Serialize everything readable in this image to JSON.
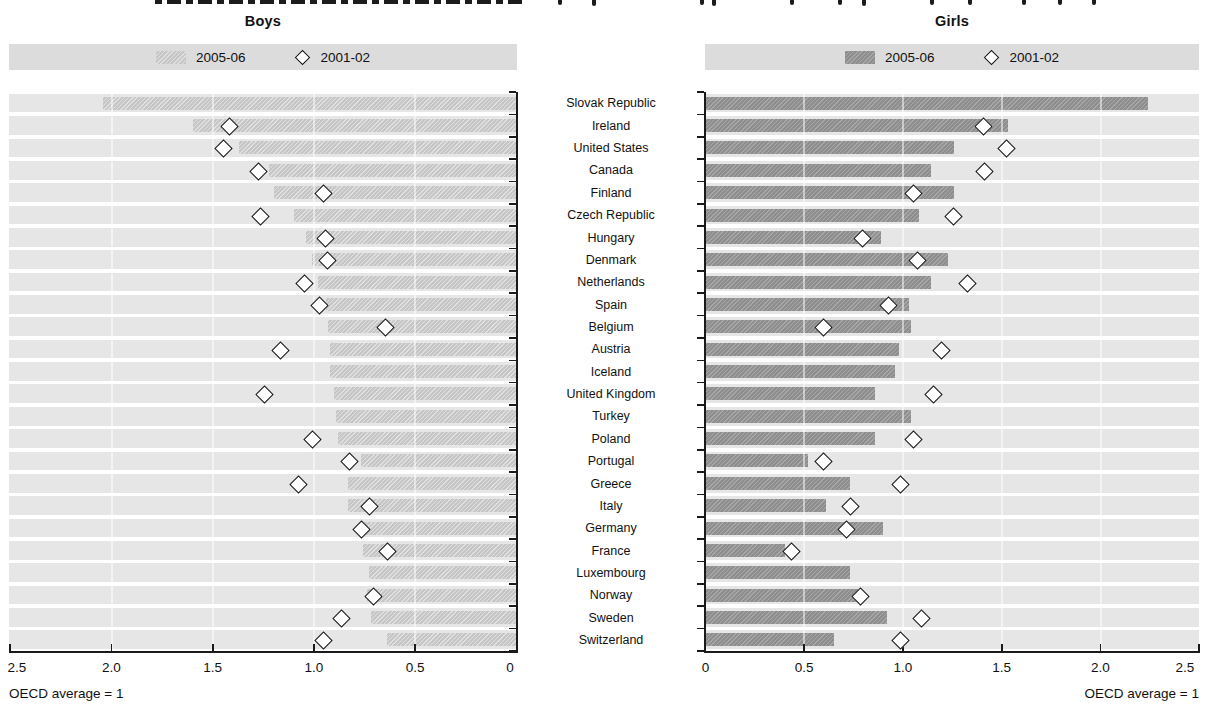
{
  "figure": {
    "cropped_title_visible": true,
    "note_left": "OECD average = 1",
    "note_right": "OECD average = 1"
  },
  "panels": {
    "left": {
      "title": "Boys",
      "legend": {
        "bar_label": "2005-06",
        "diamond_label": "2001-02"
      },
      "axis_ticks": [
        "2.5",
        "2.0",
        "1.5",
        "1.0",
        "0.5",
        "0"
      ]
    },
    "right": {
      "title": "Girls",
      "legend": {
        "bar_label": "2005-06",
        "diamond_label": "2001-02"
      },
      "axis_ticks": [
        "0",
        "0.5",
        "1.0",
        "1.5",
        "2.0",
        "2.5"
      ]
    }
  },
  "colors": {
    "row_band": "#e6e6e6",
    "boys_bar": "#c6c6c6",
    "girls_bar": "#8e8e8e",
    "legend_band": "#dcdcdc",
    "axis": "#1a1a1a",
    "diamond_fill": "#ffffff"
  },
  "chart_data": {
    "type": "bar",
    "layout": "horizontal back-to-back pyramid, boys axis reversed (2.5 to 0), girls axis 0 to 2.5",
    "xlim": [
      0,
      2.5
    ],
    "grid": "white vertical gridlines every 0.5",
    "note": "OECD average = 1",
    "categories": [
      "Slovak Republic",
      "Ireland",
      "United States",
      "Canada",
      "Finland",
      "Czech Republic",
      "Hungary",
      "Denmark",
      "Netherlands",
      "Spain",
      "Belgium",
      "Austria",
      "Iceland",
      "United Kingdom",
      "Turkey",
      "Poland",
      "Portugal",
      "Greece",
      "Italy",
      "Germany",
      "France",
      "Luxembourg",
      "Norway",
      "Sweden",
      "Switzerland"
    ],
    "series": [
      {
        "name": "Boys 2005-06",
        "marker": "bar",
        "values": [
          2.04,
          1.6,
          1.37,
          1.22,
          1.2,
          1.1,
          1.04,
          1.01,
          0.98,
          0.94,
          0.93,
          0.92,
          0.92,
          0.9,
          0.89,
          0.88,
          0.77,
          0.83,
          0.83,
          0.78,
          0.76,
          0.73,
          0.74,
          0.72,
          0.64
        ]
      },
      {
        "name": "Boys 2001-02",
        "marker": "diamond",
        "values": [
          null,
          1.42,
          1.45,
          1.28,
          0.96,
          1.27,
          0.95,
          0.94,
          1.05,
          0.98,
          0.65,
          1.17,
          null,
          1.25,
          null,
          1.01,
          0.83,
          1.08,
          0.73,
          0.77,
          0.64,
          null,
          0.71,
          0.87,
          0.96
        ]
      },
      {
        "name": "Girls 2005-06",
        "marker": "bar",
        "values": [
          2.24,
          1.53,
          1.26,
          1.14,
          1.26,
          1.08,
          0.89,
          1.23,
          1.14,
          1.03,
          1.04,
          0.98,
          0.96,
          0.86,
          1.04,
          0.86,
          0.52,
          0.73,
          0.61,
          0.9,
          0.4,
          0.73,
          0.77,
          0.92,
          0.65
        ]
      },
      {
        "name": "Girls 2001-02",
        "marker": "diamond",
        "values": [
          null,
          1.4,
          1.52,
          1.41,
          1.05,
          1.25,
          0.79,
          1.07,
          1.32,
          0.92,
          0.59,
          1.19,
          null,
          1.15,
          null,
          1.05,
          0.59,
          0.98,
          0.73,
          0.71,
          0.43,
          null,
          0.78,
          1.09,
          0.98
        ]
      }
    ]
  }
}
